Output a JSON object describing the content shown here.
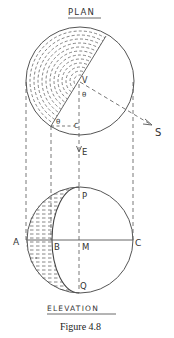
{
  "figure": {
    "caption": "Figure 4.8",
    "plan_title": "PLAN",
    "elevation_title": "ELEVATION"
  },
  "plan": {
    "labels": {
      "v": "V",
      "theta_upper": "θ",
      "theta_lower": "θ",
      "c": "C",
      "s": "S",
      "e": "E"
    }
  },
  "elevation": {
    "labels": {
      "a": "A",
      "b": "B",
      "m": "M",
      "c": "C",
      "p": "P",
      "q": "Q"
    }
  },
  "colors": {
    "line": "#555555",
    "hatch": "#666666",
    "text": "#333333",
    "background": "#ffffff"
  }
}
